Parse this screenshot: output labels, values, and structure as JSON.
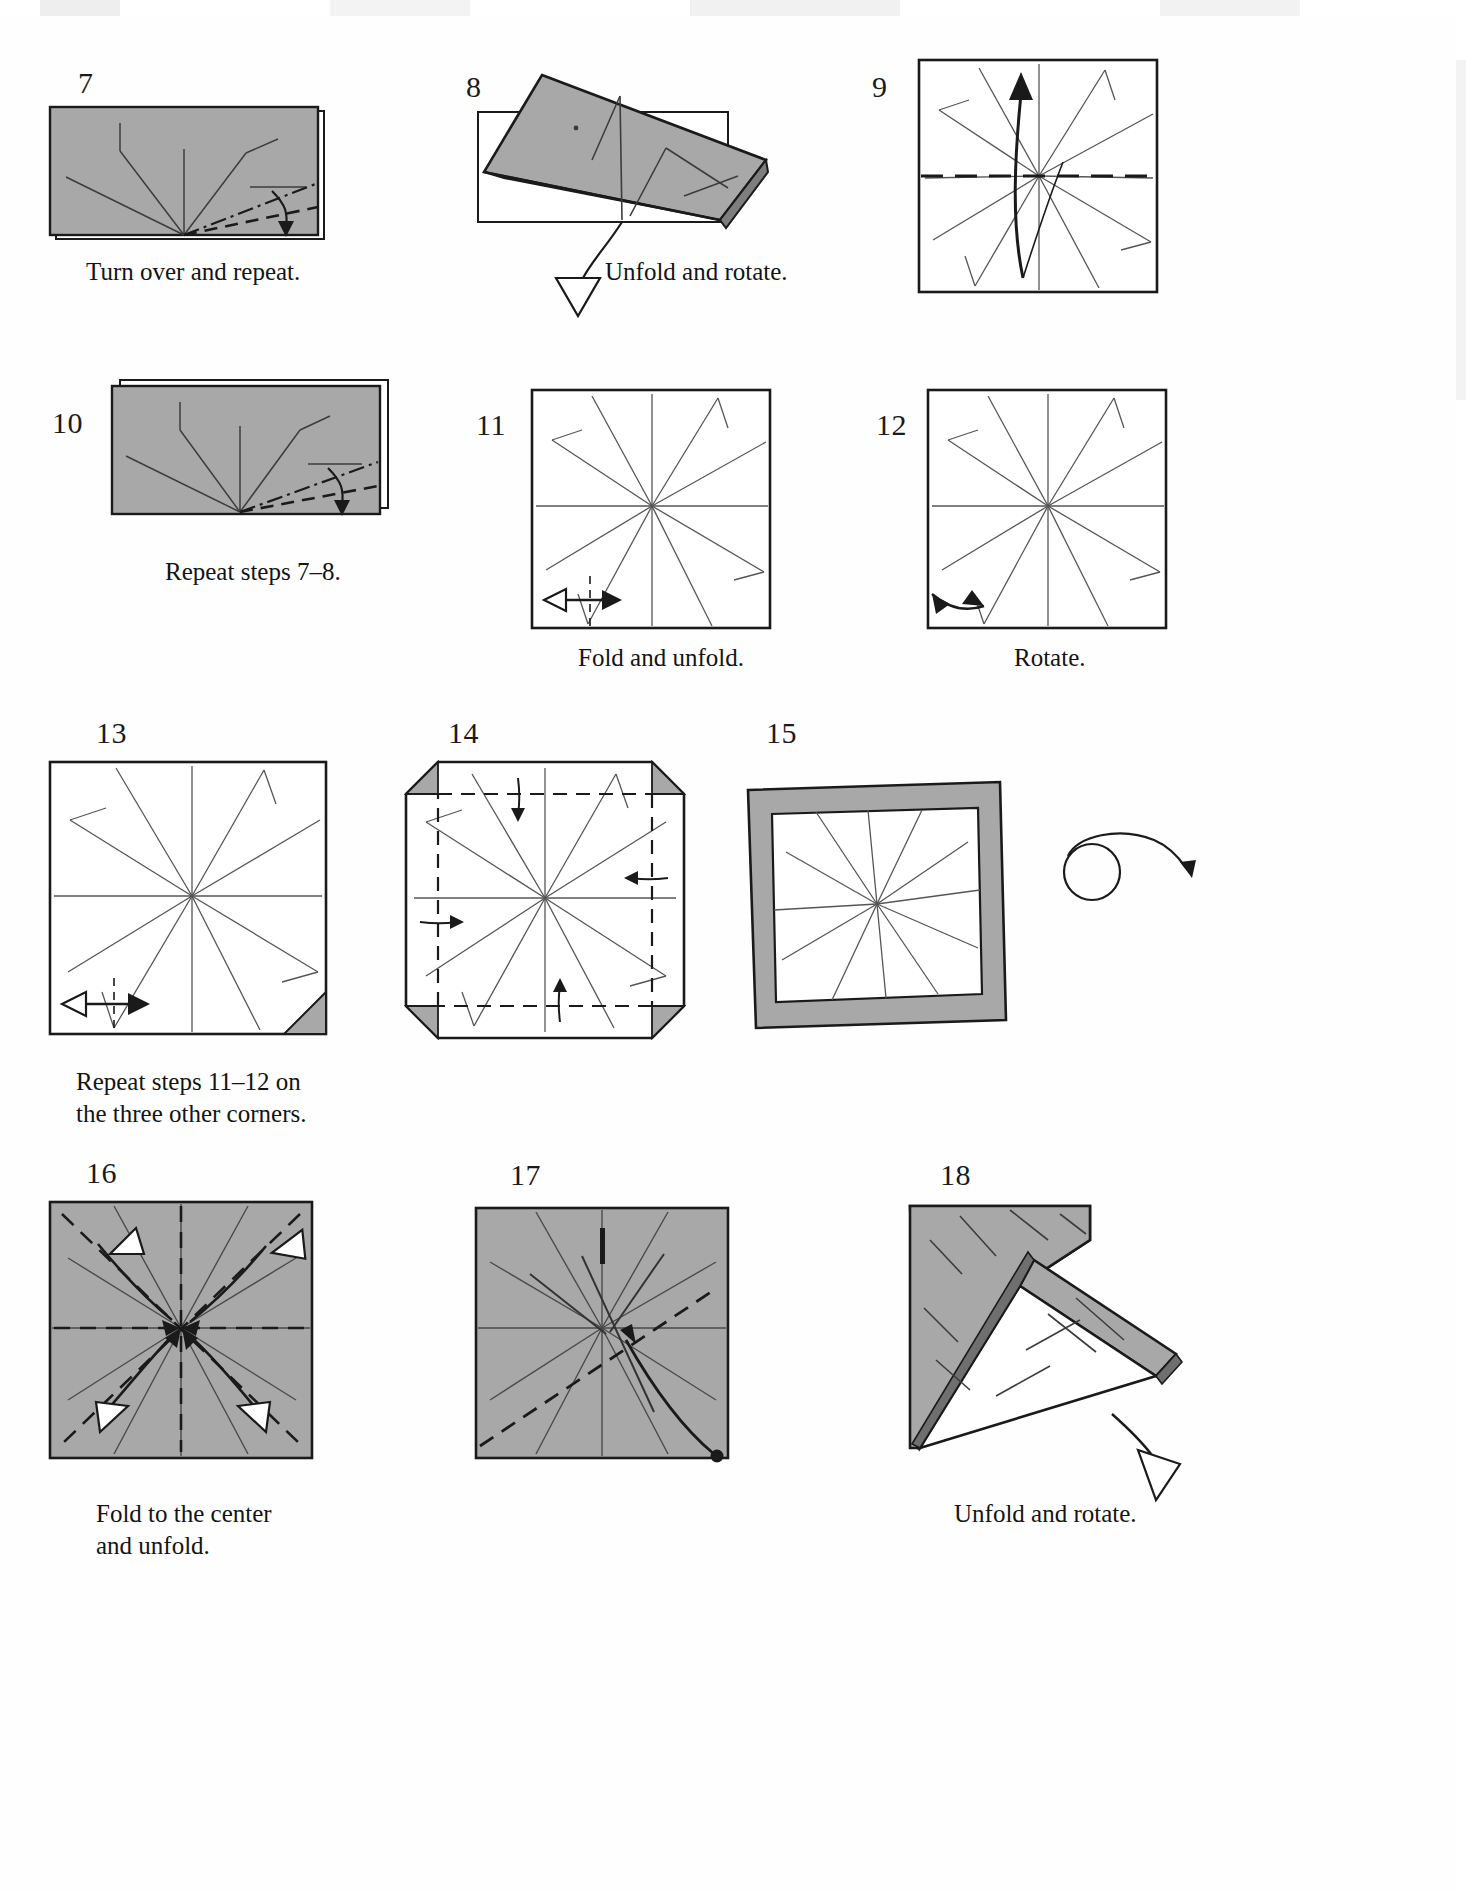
{
  "page": {
    "background_color": "#ffffff",
    "paper_fill": "#a8a8a8",
    "paper_fill_light": "#b4b4b4",
    "line_color": "#1a1a1a",
    "crease_color": "#555555",
    "width": 1466,
    "height": 1891
  },
  "steps": [
    {
      "number": "7",
      "caption": "Turn over and repeat.",
      "shape": "horizontal-rectangle-gray",
      "marks": [
        "mountain-fold-dash-dot",
        "valley-fold-dashed",
        "fold-arrow-down"
      ]
    },
    {
      "number": "8",
      "caption": "Unfold and rotate.",
      "shape": "tilted-folded-flap-gray",
      "marks": [
        "hollow-unfold-arrow"
      ]
    },
    {
      "number": "9",
      "caption": "",
      "shape": "square-white-creases",
      "marks": [
        "horizontal-dashed-line",
        "curved-fold-arrow-up"
      ]
    },
    {
      "number": "10",
      "caption": "Repeat steps 7–8.",
      "shape": "horizontal-rectangle-gray",
      "marks": [
        "mountain-fold-dash-dot",
        "valley-fold-dashed",
        "fold-arrow-down"
      ]
    },
    {
      "number": "11",
      "caption": "Fold and unfold.",
      "shape": "square-white-creases",
      "marks": [
        "double-headed-measure-arrow",
        "dashed-reference-line"
      ]
    },
    {
      "number": "12",
      "caption": "Rotate.",
      "shape": "square-white-creases",
      "marks": [
        "rotate-corner-arrow"
      ]
    },
    {
      "number": "13",
      "caption": "Repeat steps 11–12 on\nthe three other corners.",
      "shape": "square-white-creases-corner-flap",
      "marks": [
        "double-headed-measure-arrow",
        "gray-corner-flap"
      ]
    },
    {
      "number": "14",
      "caption": "",
      "shape": "square-white-four-corners-folded",
      "marks": [
        "dashed-fold-lines-four-sides",
        "four-fold-arrows",
        "four-gray-corner-triangles"
      ]
    },
    {
      "number": "15",
      "caption": "",
      "shape": "square-white-gray-border-frame",
      "marks": [
        "turn-over-symbol"
      ]
    },
    {
      "number": "16",
      "caption": "Fold to the center\nand unfold.",
      "shape": "square-gray-creases",
      "marks": [
        "four-white-arrowheads",
        "diagonal-dashed-fold-lines",
        "curved-fold-arrows-to-center"
      ]
    },
    {
      "number": "17",
      "caption": "",
      "shape": "square-gray-creases",
      "marks": [
        "long-curved-arrow-with-dot",
        "diagonal-dashed-line"
      ]
    },
    {
      "number": "18",
      "caption": "Unfold and rotate.",
      "shape": "folded-bent-gray-flap",
      "marks": [
        "hollow-unfold-arrow"
      ]
    }
  ],
  "captions": {
    "step7": "Turn over and repeat.",
    "step8": "Unfold and rotate.",
    "step10": "Repeat steps 7–8.",
    "step11": "Fold and unfold.",
    "step12": "Rotate.",
    "step13": "Repeat steps 11–12 on\nthe three other corners.",
    "step16": "Fold to the center\nand unfold.",
    "step18": "Unfold and rotate."
  },
  "numbers": {
    "n7": "7",
    "n8": "8",
    "n9": "9",
    "n10": "10",
    "n11": "11",
    "n12": "12",
    "n13": "13",
    "n14": "14",
    "n15": "15",
    "n16": "16",
    "n17": "17",
    "n18": "18"
  }
}
